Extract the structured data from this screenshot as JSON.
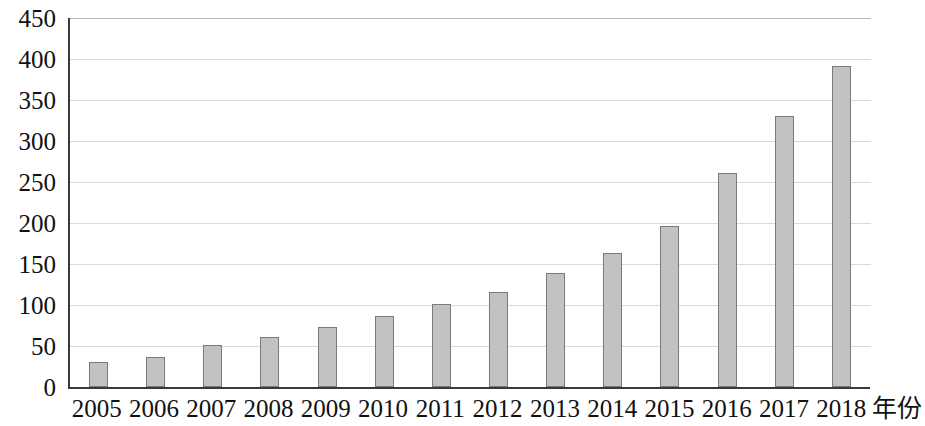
{
  "chart_data": {
    "type": "bar",
    "title": "",
    "xlabel": "年份",
    "ylabel": "",
    "categories": [
      "2005",
      "2006",
      "2007",
      "2008",
      "2009",
      "2010",
      "2011",
      "2012",
      "2013",
      "2014",
      "2015",
      "2016",
      "2017",
      "2018"
    ],
    "values": [
      30,
      37,
      51,
      61,
      73,
      87,
      101,
      116,
      139,
      164,
      196,
      261,
      331,
      392
    ],
    "ylim": [
      0,
      450
    ],
    "y_ticks": [
      0,
      50,
      100,
      150,
      200,
      250,
      300,
      350,
      400,
      450
    ],
    "y_tick_labels": [
      "0",
      "50",
      "100",
      "150",
      "200",
      "250",
      "300",
      "350",
      "400",
      "450"
    ],
    "grid": true,
    "legend": false,
    "bar_color": "#c2c2c2",
    "bar_border_color": "#7a7a7a",
    "gridline_color": "#d9d9d9",
    "axis_color": "#3a3a3a"
  }
}
